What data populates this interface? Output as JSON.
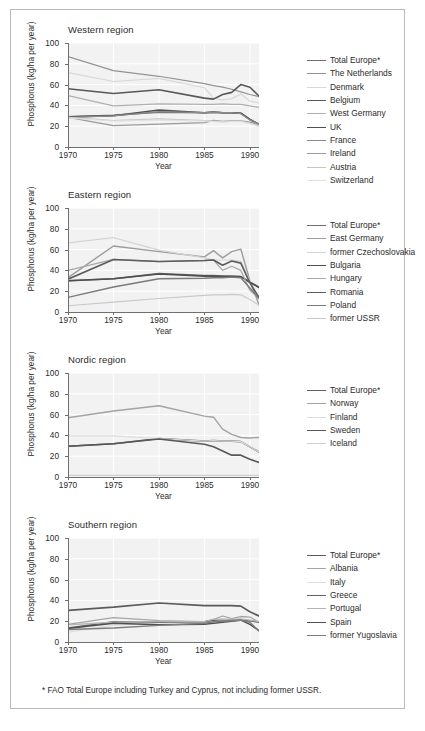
{
  "figure": {
    "footnote": "* FAO Total Europe including Turkey and Cyprus, not including former USSR.",
    "axis": {
      "xlabel": "Year",
      "ylabel": "Phosphorus (kg/ha per year)",
      "yticks": [
        "0",
        "20",
        "40",
        "60",
        "80",
        "100"
      ],
      "xticks": [
        "1970",
        "1975",
        "1980",
        "1985",
        "1990"
      ]
    }
  },
  "chart_data": [
    {
      "type": "line",
      "title": "Western region",
      "xlabel": "Year",
      "ylabel": "Phosphorus (kg/ha per year)",
      "xlim": [
        1970,
        1991
      ],
      "ylim": [
        0,
        100
      ],
      "xticks": [
        1970,
        1975,
        1980,
        1985,
        1990
      ],
      "yticks": [
        0,
        20,
        40,
        60,
        80,
        100
      ],
      "grid": true,
      "legend_position": "right",
      "x": [
        1970,
        1975,
        1980,
        1985,
        1986,
        1987,
        1988,
        1989,
        1990,
        1991
      ],
      "series": [
        {
          "name": "Total Europe*",
          "color": "#6e6e6e",
          "width": 1.5,
          "values": [
            29.0,
            30.5,
            33.5,
            33.0,
            33.5,
            33.0,
            33.0,
            32.5,
            26.5,
            22.0
          ]
        },
        {
          "name": "The Netherlands",
          "color": "#939393",
          "width": 1.2,
          "values": [
            87.0,
            73.5,
            68.0,
            61.0,
            59.0,
            57.5,
            55.5,
            53.0,
            50.5,
            48.5
          ]
        },
        {
          "name": "Denmark",
          "color": "#d8d8d8",
          "width": 1.2,
          "values": [
            71.5,
            63.0,
            66.0,
            57.0,
            47.0,
            45.0,
            46.5,
            51.0,
            44.0,
            42.5
          ]
        },
        {
          "name": "Belgium",
          "color": "#585858",
          "width": 1.6,
          "values": [
            56.0,
            51.5,
            55.0,
            47.0,
            46.0,
            50.5,
            52.5,
            60.0,
            57.5,
            49.0
          ]
        },
        {
          "name": "West Germany",
          "color": "#b0b0b0",
          "width": 1.2,
          "values": [
            49.5,
            39.5,
            41.5,
            41.0,
            41.0,
            41.5,
            41.0,
            41.0,
            39.5,
            38.0
          ]
        },
        {
          "name": "UK",
          "color": "#4f4f4f",
          "width": 1.6,
          "values": [
            29.0,
            30.0,
            35.5,
            33.0,
            33.5,
            33.0,
            33.0,
            32.5,
            26.5,
            21.5
          ]
        },
        {
          "name": "France",
          "color": "#8a8a8a",
          "width": 1.3,
          "values": [
            28.5,
            30.0,
            34.0,
            33.0,
            33.5,
            33.0,
            33.0,
            32.0,
            26.0,
            22.0
          ]
        },
        {
          "name": "Ireland",
          "color": "#9b9b9b",
          "width": 1.3,
          "values": [
            28.5,
            20.5,
            22.0,
            23.5,
            25.5,
            24.5,
            25.0,
            25.0,
            24.0,
            21.5
          ]
        },
        {
          "name": "Austria",
          "color": "#c4c4c4",
          "width": 1.2,
          "values": [
            28.5,
            25.5,
            27.0,
            25.5,
            25.0,
            24.5,
            25.0,
            25.0,
            23.0,
            20.0
          ]
        },
        {
          "name": "Switzerland",
          "color": "#e0e0e0",
          "width": 1.2,
          "values": [
            28.0,
            25.0,
            26.0,
            25.0,
            24.5,
            24.0,
            24.5,
            24.5,
            22.5,
            19.5
          ]
        }
      ]
    },
    {
      "type": "line",
      "title": "Eastern region",
      "xlabel": "Year",
      "ylabel": "Phosphorus (kg/ha per year)",
      "xlim": [
        1970,
        1991
      ],
      "ylim": [
        0,
        100
      ],
      "xticks": [
        1970,
        1975,
        1980,
        1985,
        1990
      ],
      "yticks": [
        0,
        20,
        40,
        60,
        80,
        100
      ],
      "grid": true,
      "legend_position": "right",
      "x": [
        1970,
        1975,
        1980,
        1985,
        1986,
        1987,
        1988,
        1989,
        1990,
        1991
      ],
      "series": [
        {
          "name": "Total Europe*",
          "color": "#6e6e6e",
          "width": 1.5,
          "values": [
            30.0,
            32.0,
            37.0,
            35.0,
            35.0,
            34.5,
            34.5,
            34.0,
            29.0,
            24.0
          ]
        },
        {
          "name": "East Germany",
          "color": "#9c9c9c",
          "width": 1.4,
          "values": [
            33.0,
            63.5,
            58.0,
            53.0,
            59.0,
            52.0,
            58.0,
            60.5,
            30.0,
            7.0
          ]
        },
        {
          "name": "former Czechoslovakia",
          "color": "#d4d4d4",
          "width": 1.2,
          "values": [
            66.5,
            71.5,
            59.5,
            52.0,
            50.0,
            50.0,
            50.0,
            49.0,
            30.0,
            13.0
          ]
        },
        {
          "name": "Bulgaria",
          "color": "#4f4f4f",
          "width": 1.6,
          "values": [
            30.0,
            32.0,
            36.5,
            34.5,
            34.5,
            34.0,
            34.0,
            34.0,
            28.5,
            23.5
          ]
        },
        {
          "name": "Hungary",
          "color": "#a8a8a8",
          "width": 1.3,
          "values": [
            40.0,
            50.5,
            48.5,
            49.5,
            50.0,
            40.0,
            44.0,
            40.0,
            21.0,
            13.0
          ]
        },
        {
          "name": "Romania",
          "color": "#5c5c5c",
          "width": 1.6,
          "values": [
            31.5,
            50.5,
            48.5,
            49.5,
            50.0,
            45.0,
            49.0,
            47.0,
            28.0,
            14.0
          ]
        },
        {
          "name": "Poland",
          "color": "#7a7a7a",
          "width": 1.4,
          "values": [
            14.0,
            24.0,
            32.0,
            32.5,
            33.0,
            33.0,
            33.5,
            33.0,
            23.0,
            13.0
          ]
        },
        {
          "name": "former USSR",
          "color": "#c9c9c9",
          "width": 1.2,
          "values": [
            6.0,
            9.5,
            13.0,
            16.0,
            16.5,
            16.5,
            17.0,
            16.5,
            12.0,
            6.5
          ]
        }
      ]
    },
    {
      "type": "line",
      "title": "Nordic region",
      "xlabel": "Year",
      "ylabel": "Phosphorus (kg/ha per year)",
      "xlim": [
        1970,
        1991
      ],
      "ylim": [
        0,
        100
      ],
      "xticks": [
        1970,
        1975,
        1980,
        1985,
        1990
      ],
      "yticks": [
        0,
        20,
        40,
        60,
        80,
        100
      ],
      "grid": true,
      "legend_position": "right",
      "x": [
        1970,
        1975,
        1980,
        1985,
        1986,
        1987,
        1988,
        1989,
        1990,
        1991
      ],
      "series": [
        {
          "name": "Total Europe*",
          "color": "#5f5f5f",
          "width": 1.6,
          "values": [
            29.5,
            32.0,
            37.0,
            34.5,
            35.0,
            34.5,
            34.5,
            34.0,
            29.0,
            24.0
          ]
        },
        {
          "name": "Norway",
          "color": "#a3a3a3",
          "width": 1.4,
          "values": [
            57.0,
            63.5,
            68.5,
            58.5,
            57.5,
            46.0,
            41.0,
            38.0,
            37.5,
            38.0
          ]
        },
        {
          "name": "Finland",
          "color": "#dcdcdc",
          "width": 1.2,
          "values": [
            39.5,
            39.5,
            37.0,
            34.5,
            35.0,
            34.5,
            34.5,
            34.0,
            29.0,
            24.0
          ]
        },
        {
          "name": "Sweden",
          "color": "#585858",
          "width": 1.6,
          "values": [
            29.5,
            32.0,
            36.5,
            31.5,
            29.0,
            25.0,
            21.0,
            21.0,
            17.0,
            14.0
          ]
        },
        {
          "name": "Iceland",
          "color": "#d0d0d0",
          "width": 1.2,
          "values": [
            1.5,
            1.5,
            1.5,
            1.5,
            1.5,
            1.5,
            1.5,
            1.5,
            1.5,
            1.5
          ]
        }
      ]
    },
    {
      "type": "line",
      "title": "Southern region",
      "xlabel": "Year",
      "ylabel": "Phosphorus (kg/ha per year)",
      "xlim": [
        1970,
        1991
      ],
      "ylim": [
        0,
        100
      ],
      "xticks": [
        1970,
        1975,
        1980,
        1985,
        1990
      ],
      "yticks": [
        0,
        20,
        40,
        60,
        80,
        100
      ],
      "grid": true,
      "legend_position": "right",
      "x": [
        1970,
        1975,
        1980,
        1985,
        1986,
        1987,
        1988,
        1989,
        1990,
        1991
      ],
      "series": [
        {
          "name": "Total Europe*",
          "color": "#5a5a5a",
          "width": 1.7,
          "values": [
            30.5,
            33.5,
            37.5,
            35.0,
            35.0,
            35.0,
            35.0,
            34.5,
            29.0,
            25.0
          ]
        },
        {
          "name": "Albania",
          "color": "#a5a5a5",
          "width": 1.3,
          "values": [
            17.0,
            23.5,
            20.5,
            19.5,
            21.5,
            25.0,
            22.5,
            24.5,
            24.0,
            19.0
          ]
        },
        {
          "name": "Italy",
          "color": "#dedede",
          "width": 1.2,
          "values": [
            9.5,
            16.0,
            18.5,
            19.0,
            20.0,
            19.5,
            21.0,
            21.0,
            20.0,
            19.0
          ]
        },
        {
          "name": "Greece",
          "color": "#636363",
          "width": 1.6,
          "values": [
            13.5,
            19.5,
            19.0,
            19.5,
            21.0,
            21.5,
            21.0,
            21.0,
            20.5,
            19.0
          ]
        },
        {
          "name": "Portugal",
          "color": "#b4b4b4",
          "width": 1.3,
          "values": [
            16.5,
            19.0,
            19.5,
            19.5,
            22.0,
            21.5,
            22.0,
            22.0,
            21.0,
            19.5
          ]
        },
        {
          "name": "Spain",
          "color": "#4f4f4f",
          "width": 1.5,
          "values": [
            13.0,
            18.0,
            16.5,
            17.0,
            18.0,
            19.0,
            20.0,
            21.0,
            17.0,
            11.0
          ]
        },
        {
          "name": "former Yugoslavia",
          "color": "#7d7d7d",
          "width": 1.4,
          "values": [
            12.0,
            13.5,
            16.0,
            18.0,
            19.5,
            20.0,
            20.5,
            21.0,
            19.0,
            10.5
          ]
        }
      ]
    }
  ]
}
